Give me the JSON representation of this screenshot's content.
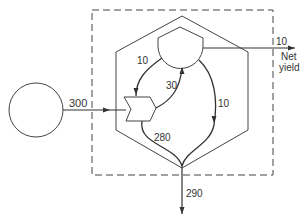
{
  "diagram": {
    "type": "energy-flow",
    "colors": {
      "stroke": "#333333",
      "background": "#ffffff"
    },
    "nodes": {
      "source": {
        "shape": "circle",
        "label": ""
      },
      "producer": {
        "shape": "chevron",
        "label": ""
      },
      "consumer": {
        "shape": "tank",
        "label": ""
      },
      "system_boundary": {
        "shape": "dashed-rectangle"
      },
      "ecosystem": {
        "shape": "hexagon"
      }
    },
    "flows": {
      "input": {
        "value": "300",
        "from": "source",
        "to": "producer"
      },
      "producer_to_consumer": {
        "value": "30",
        "from": "producer",
        "to": "consumer"
      },
      "consumer_to_producer": {
        "value": "10",
        "from": "consumer",
        "to": "producer"
      },
      "consumer_to_sink": {
        "value": "10",
        "from": "consumer",
        "to": "sink"
      },
      "producer_to_sink": {
        "value": "280",
        "from": "producer",
        "to": "sink"
      },
      "net_yield": {
        "value": "10",
        "label_line1": "Net",
        "label_line2": "yield"
      },
      "heat_sink": {
        "value": "290"
      }
    }
  }
}
